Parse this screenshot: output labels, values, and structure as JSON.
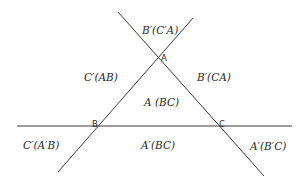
{
  "diagram": {
    "type": "line-arrangement",
    "vertices": {
      "A": {
        "label": "A",
        "x": 158,
        "y": 58
      },
      "B": {
        "label": "B",
        "x": 97,
        "y": 126
      },
      "C": {
        "label": "C",
        "x": 219,
        "y": 126
      }
    },
    "lines": [
      {
        "name": "line-BC",
        "x1": 17,
        "y1": 126,
        "x2": 292,
        "y2": 126
      },
      {
        "name": "line-AB",
        "x1": 58,
        "y1": 172,
        "x2": 193,
        "y2": 18
      },
      {
        "name": "line-AC",
        "x1": 118,
        "y1": 12,
        "x2": 264,
        "y2": 176
      }
    ],
    "regions": {
      "top": "B′(C′A)",
      "upper_left": "C′(AB)",
      "upper_right": "B′(CA)",
      "center": "A (BC)",
      "lower_left": "C′(A′B)",
      "lower_center": "A′(BC)",
      "lower_right": "A′(B′C)"
    }
  }
}
